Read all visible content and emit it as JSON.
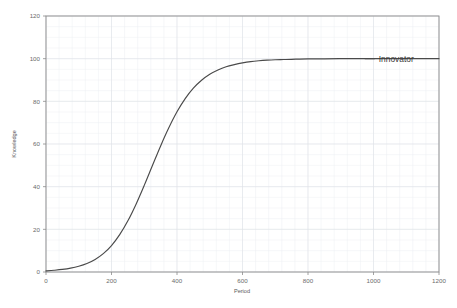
{
  "chart_data": {
    "type": "line",
    "title": "",
    "xlabel": "Period",
    "ylabel": "Knowledge",
    "xlim": [
      0,
      1200
    ],
    "ylim": [
      0,
      120
    ],
    "xticks": [
      0,
      200,
      400,
      600,
      800,
      1000,
      1200
    ],
    "yticks": [
      0,
      20,
      40,
      60,
      80,
      100,
      120
    ],
    "xtick_labels": [
      "0",
      "200",
      "400",
      "600",
      "800",
      "1000",
      "1200"
    ],
    "ytick_labels": [
      "0",
      "20",
      "40",
      "60",
      "80",
      "100",
      "120"
    ],
    "grid": true,
    "legend_position": "inline-right",
    "series": [
      {
        "name": "Innovator",
        "color": "#4a4a4a",
        "x": [
          0,
          25,
          50,
          75,
          100,
          125,
          150,
          175,
          200,
          225,
          250,
          275,
          300,
          325,
          350,
          375,
          400,
          425,
          450,
          475,
          500,
          525,
          550,
          575,
          600,
          625,
          650,
          675,
          700,
          725,
          750,
          800,
          850,
          900,
          950,
          1000,
          1050,
          1100,
          1150,
          1200
        ],
        "values": [
          0.5,
          0.8,
          1.2,
          1.8,
          2.7,
          4.0,
          5.9,
          8.6,
          12.4,
          17.5,
          24.0,
          31.8,
          40.6,
          49.9,
          59.1,
          67.6,
          75.1,
          81.3,
          86.2,
          89.9,
          92.7,
          94.7,
          96.2,
          97.2,
          98.0,
          98.6,
          99.0,
          99.3,
          99.5,
          99.6,
          99.7,
          99.9,
          99.9,
          100.0,
          100.0,
          100.0,
          100.0,
          100.0,
          100.0,
          100.0
        ]
      }
    ],
    "annotations": [
      {
        "text": "Innovator",
        "x": 1010,
        "y": 100
      }
    ]
  },
  "axes": {
    "y_title": "Knowledge",
    "x_title": "Period"
  },
  "legend": {
    "innovator_label": "Innovator"
  },
  "colors": {
    "line": "#4a4a4a",
    "frame": "#8c8c8c",
    "grid_minor": "#eceef2",
    "grid_major": "#dfe2e8",
    "text": "#5a5a5a",
    "background": "#ffffff"
  }
}
